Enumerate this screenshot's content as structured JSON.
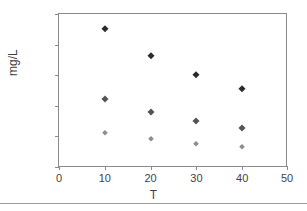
{
  "chart_data": {
    "type": "scatter",
    "title": "",
    "xlabel": "T",
    "ylabel": "mg/L",
    "xlim": [
      0,
      50
    ],
    "ylim": [
      0,
      50
    ],
    "xticks": [
      0,
      10,
      20,
      30,
      40,
      50
    ],
    "yticks": [
      0,
      10,
      20,
      30,
      40,
      50
    ],
    "grid": false,
    "legend": "none",
    "x": [
      10,
      20,
      30,
      40
    ],
    "series": [
      {
        "name": "series-1",
        "marker": "diamond",
        "color": "#2b2b2b",
        "values": [
          45.0,
          36.3,
          30.3,
          25.8
        ]
      },
      {
        "name": "series-2",
        "marker": "diamond",
        "color": "#545454",
        "values": [
          22.5,
          18.1,
          15.1,
          13.0
        ]
      },
      {
        "name": "series-3",
        "marker": "diamond",
        "color": "#8d8d8d",
        "values": [
          11.3,
          9.4,
          7.7,
          6.7
        ]
      }
    ]
  },
  "axes": {
    "y_tick_labels": [
      "50",
      "40",
      "30",
      "20",
      "10",
      "0"
    ],
    "x_tick_labels": [
      "0",
      "10",
      "20",
      "30",
      "40",
      "50"
    ],
    "y_title": "mg/L",
    "x_title": "T"
  }
}
